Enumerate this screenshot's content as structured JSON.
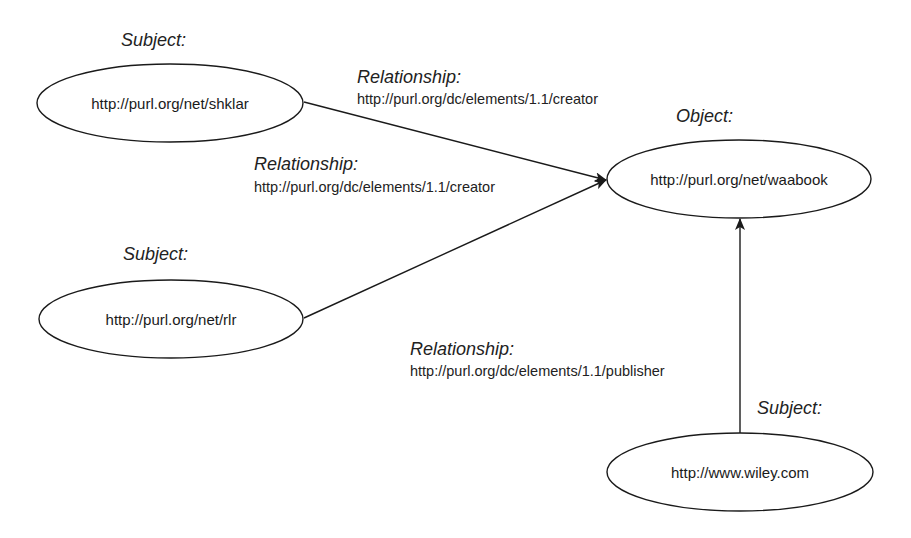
{
  "diagram": {
    "type": "rdf-graph",
    "nodes": [
      {
        "id": "shklar",
        "role": "Subject:",
        "uri": "http://purl.org/net/shklar"
      },
      {
        "id": "rlr",
        "role": "Subject:",
        "uri": "http://purl.org/net/rlr"
      },
      {
        "id": "waabook",
        "role": "Object:",
        "uri": "http://purl.org/net/waabook"
      },
      {
        "id": "wiley",
        "role": "Subject:",
        "uri": "http://www.wiley.com"
      }
    ],
    "edges": [
      {
        "from": "shklar",
        "to": "waabook",
        "role": "Relationship:",
        "uri": "http://purl.org/dc/elements/1.1/creator"
      },
      {
        "from": "rlr",
        "to": "waabook",
        "role": "Relationship:",
        "uri": "http://purl.org/dc/elements/1.1/creator"
      },
      {
        "from": "wiley",
        "to": "waabook",
        "role": "Relationship:",
        "uri": "http://purl.org/dc/elements/1.1/publisher"
      }
    ],
    "colors": {
      "stroke": "#1a1a1a",
      "background": "#ffffff"
    }
  }
}
